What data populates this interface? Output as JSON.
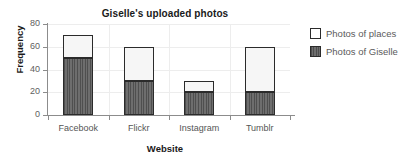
{
  "chart_data": {
    "type": "bar",
    "subtype": "stacked-vertical",
    "title": "Giselle's uploaded photos",
    "xlabel": "Website",
    "ylabel": "Frequency",
    "categories": [
      "Facebook",
      "Flickr",
      "Instagram",
      "Tumblr"
    ],
    "series": [
      {
        "name": "Photos of Giselle",
        "values": [
          50,
          30,
          20,
          20
        ],
        "color": "#5e5e5e"
      },
      {
        "name": "Photos of places",
        "values": [
          20,
          30,
          10,
          40
        ],
        "color": "#f6f6f6"
      }
    ],
    "totals": [
      70,
      60,
      30,
      60
    ],
    "ylim": [
      0,
      80
    ],
    "yticks": [
      0,
      20,
      40,
      60,
      80
    ],
    "ytick_labels": [
      "0",
      "20",
      "40",
      "60",
      "80"
    ],
    "grid": true,
    "legend_position": "right",
    "legend_order": [
      "Photos of places",
      "Photos of Giselle"
    ]
  },
  "legend": {
    "items": [
      {
        "label": "Photos of places",
        "swatch": "white-square-icon"
      },
      {
        "label": "Photos of Giselle",
        "swatch": "dark-hatched-square-icon"
      }
    ]
  }
}
